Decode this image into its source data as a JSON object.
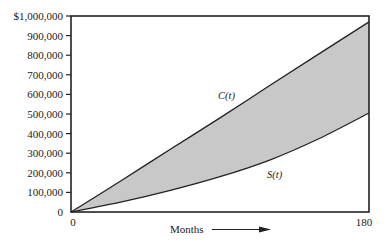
{
  "chart_data": {
    "type": "line",
    "title": "",
    "xlabel": "Months",
    "ylabel": "",
    "xlim": [
      0,
      180
    ],
    "ylim": [
      0,
      1000000
    ],
    "grid": false,
    "legend": "none (inline curve labels)",
    "x_ticks": [
      "0",
      "180"
    ],
    "y_ticks": [
      "0",
      "100,000",
      "200,000",
      "300,000",
      "400,000",
      "500,000",
      "600,000",
      "700,000",
      "800,000",
      "900,000",
      "$1,000,000"
    ],
    "y_tick_values": [
      0,
      100000,
      200000,
      300000,
      400000,
      500000,
      600000,
      700000,
      800000,
      900000,
      1000000
    ],
    "fill_between": {
      "upper": "C(t)",
      "lower": "S(t)",
      "color": "#c8c8c8"
    },
    "x": [
      0,
      30,
      60,
      90,
      120,
      150,
      180
    ],
    "series": [
      {
        "name": "C(t)",
        "values": [
          0,
          158000,
          320000,
          480000,
          645000,
          808000,
          970000
        ]
      },
      {
        "name": "S(t)",
        "values": [
          0,
          50000,
          110000,
          180000,
          265000,
          375000,
          505000
        ]
      }
    ],
    "annotations": [
      {
        "text": "C(t)",
        "x": 92,
        "y": 590000
      },
      {
        "text": "S(t)",
        "x": 120,
        "y": 180000
      },
      {
        "text": "Months →",
        "position": "below x-axis, arrow pointing right"
      }
    ]
  }
}
